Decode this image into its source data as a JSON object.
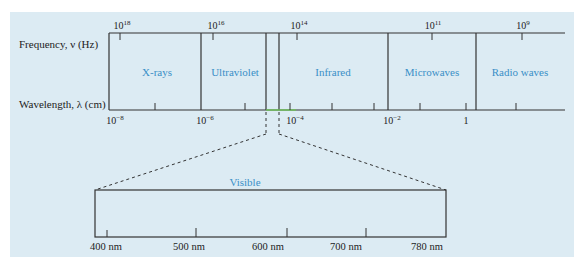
{
  "axis_labels": {
    "frequency": "Frequency, ν (Hz)",
    "wavelength": "Wavelength, λ (cm)"
  },
  "bands": [
    {
      "name": "X-rays"
    },
    {
      "name": "Ultraviolet"
    },
    {
      "name": "Infrared"
    },
    {
      "name": "Microwaves"
    },
    {
      "name": "Radio waves"
    }
  ],
  "frequency_ticks": [
    {
      "base": "10",
      "exp": "18"
    },
    {
      "base": "10",
      "exp": "16"
    },
    {
      "base": "10",
      "exp": "14"
    },
    {
      "base": "10",
      "exp": "11"
    },
    {
      "base": "10",
      "exp": "9"
    }
  ],
  "wavelength_ticks": [
    {
      "base": "10",
      "exp": "−8"
    },
    {
      "base": "10",
      "exp": "−6"
    },
    {
      "base": "10",
      "exp": "−4"
    },
    {
      "base": "10",
      "exp": "−2"
    },
    {
      "base": "1",
      "exp": ""
    }
  ],
  "visible": {
    "title": "Visible",
    "ticks": [
      "400 nm",
      "500 nm",
      "600 nm",
      "700 nm",
      "780 nm"
    ]
  },
  "colors": {
    "background": "#dcebf3",
    "band_label": "#3a8fc7",
    "visible_highlight": "#6fbf5a"
  }
}
